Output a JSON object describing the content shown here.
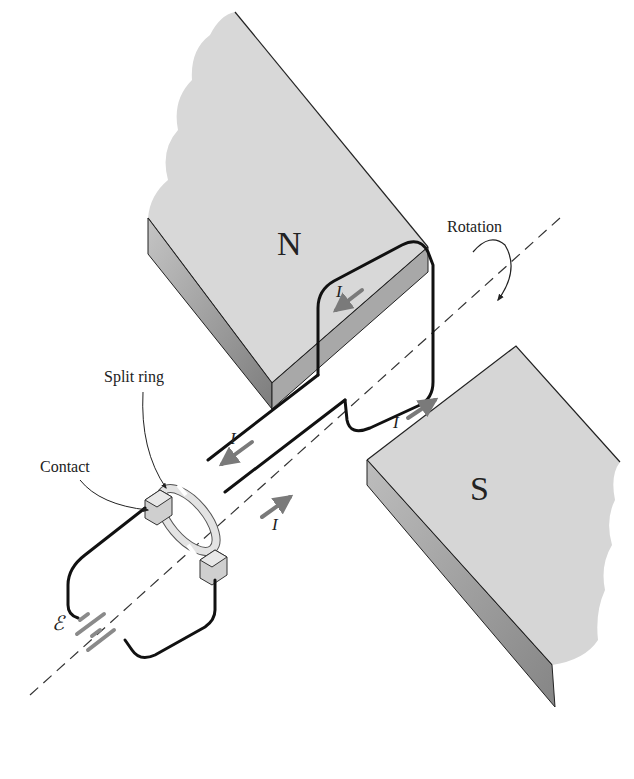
{
  "diagram": {
    "labels": {
      "north_pole": "N",
      "south_pole": "S",
      "rotation": "Rotation",
      "split_ring": "Split ring",
      "contact": "Contact",
      "emf": "ℰ",
      "current": "I"
    },
    "current_arrows": [
      {
        "label": "I",
        "location": "top side of loop near N pole",
        "direction": "down-left"
      },
      {
        "label": "I",
        "location": "bottom side of loop near S pole",
        "direction": "up-right"
      },
      {
        "label": "I",
        "location": "upper lead to split ring",
        "direction": "down-left"
      },
      {
        "label": "I",
        "location": "lower lead from split ring",
        "direction": "up-right"
      }
    ],
    "colors": {
      "magnet_top": "#d9d9d9",
      "magnet_side": "#9a9a9a",
      "wire": "#111111",
      "current_arrow": "#7a7a7a",
      "ring": "#e6e6e6"
    }
  }
}
